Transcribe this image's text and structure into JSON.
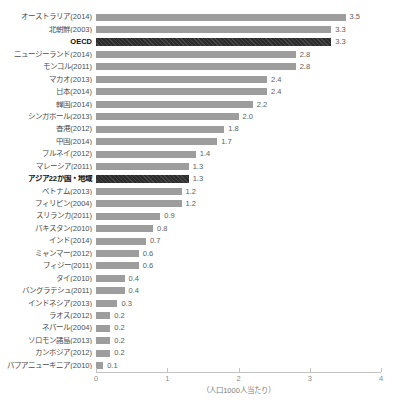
{
  "chart_data": {
    "type": "bar",
    "orientation": "horizontal",
    "title": "",
    "xlabel": "（人口1000人当たり）",
    "xlim": [
      0,
      4
    ],
    "x_ticks": [
      "0",
      "1",
      "2",
      "3",
      "4"
    ],
    "grid": false,
    "legend": false,
    "bar_color": "#9d9d9d",
    "emphasis_color": "#2f2f2f",
    "emphasized_indices": [
      2,
      13
    ],
    "categories": [
      "オーストラリア(2014)",
      "北朝鮮(2003)",
      "OECD",
      "ニュージーランド(2014)",
      "モンゴル(2011)",
      "マカオ(2013)",
      "日本(2014)",
      "韓国(2014)",
      "シンガポール(2013)",
      "香港(2012)",
      "中国(2014)",
      "ブルネイ(2012)",
      "マレーシア(2011)",
      "アジア22か国・地域",
      "ベトナム(2013)",
      "フィリピン(2004)",
      "スリランカ(2011)",
      "パキスタン(2010)",
      "インド(2014)",
      "ミャンマー(2012)",
      "フィジー(2011)",
      "タイ(2010)",
      "バングラデシュ(2011)",
      "インドネシア(2013)",
      "ラオス(2012)",
      "ネパール(2004)",
      "ソロモン諸島(2013)",
      "カンボジア(2012)",
      "パプアニューギニア(2010)"
    ],
    "values": [
      3.5,
      3.3,
      3.3,
      2.8,
      2.8,
      2.4,
      2.4,
      2.2,
      2.0,
      1.8,
      1.7,
      1.4,
      1.3,
      1.3,
      1.2,
      1.2,
      0.9,
      0.8,
      0.7,
      0.6,
      0.6,
      0.4,
      0.4,
      0.3,
      0.2,
      0.2,
      0.2,
      0.2,
      0.1
    ],
    "value_labels": [
      "3.5",
      "3.3",
      "3.3",
      "2.8",
      "2.8",
      "2.4",
      "2.4",
      "2.2",
      "2.0",
      "1.8",
      "1.7",
      "1.4",
      "1.3",
      "1.3",
      "1.2",
      "1.2",
      "0.9",
      "0.8",
      "0.7",
      "0.6",
      "0.6",
      "0.4",
      "0.4",
      "0.3",
      "0.2",
      "0.2",
      "0.2",
      "0.2",
      "0.1"
    ]
  }
}
